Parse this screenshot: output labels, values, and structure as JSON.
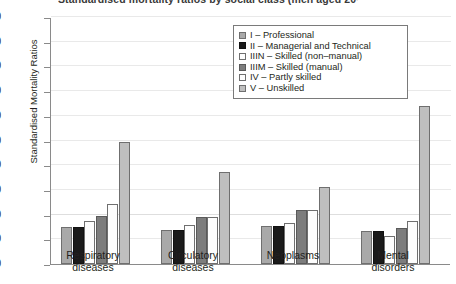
{
  "chart_data": {
    "type": "bar",
    "title": "Standardised mortality ratios by social class (men aged 20–64)",
    "xlabel": "",
    "ylabel": "Standardised Mortality Ratios",
    "ylim": [
      0,
      500
    ],
    "ytick_step": 50,
    "yticks": [
      0,
      50,
      100,
      150,
      200,
      250,
      300,
      350,
      400,
      450,
      500
    ],
    "ytick_labels": [
      "0",
      "50",
      "100",
      "150",
      "200",
      "250",
      "300",
      "350",
      "400",
      "450",
      "500"
    ],
    "grid": true,
    "legend_position": "top-right",
    "categories": [
      "Respiratory diseases",
      "Circulatory diseases",
      "Neoplasms",
      "Mental disorders"
    ],
    "category_lines": [
      [
        "Respiratory",
        "diseases"
      ],
      [
        "Circulatory",
        "diseases"
      ],
      [
        "Neoplasms",
        ""
      ],
      [
        "Mental",
        "disorders"
      ]
    ],
    "series": [
      {
        "name": "I – Professional",
        "key": "I",
        "color": "#a9a9a9",
        "values": [
          75,
          69,
          77,
          67
        ]
      },
      {
        "name": "II – Managerial and Technical",
        "key": "II",
        "color": "#1a1a1a",
        "values": [
          75,
          69,
          77,
          67
        ]
      },
      {
        "name": "IIIN – Skilled (non–manual)",
        "key": "IIIN",
        "color": "#fdfdfd",
        "values": [
          87,
          79,
          83,
          57
        ]
      },
      {
        "name": "IIIM – Skilled (manual)",
        "key": "IIIM",
        "color": "#7d7d7d",
        "values": [
          97,
          95,
          109,
          73
        ]
      },
      {
        "name": "IV – Partly skilled",
        "key": "IV",
        "color": "#fdfdfd",
        "values": [
          122,
          95,
          109,
          87
        ]
      },
      {
        "name": "V – Unskilled",
        "key": "V",
        "color": "#bfbfbf",
        "values": [
          247,
          186,
          156,
          320
        ]
      }
    ]
  }
}
